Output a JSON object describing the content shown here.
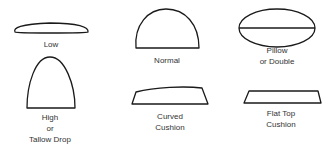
{
  "shapes": [
    {
      "id": "low",
      "lines": [
        "Low"
      ]
    },
    {
      "id": "normal",
      "lines": [
        "Normal"
      ]
    },
    {
      "id": "pillow",
      "lines": [
        "Pillow",
        "or Double"
      ]
    },
    {
      "id": "high",
      "lines": [
        "High",
        "or",
        "Tallow Drop"
      ]
    },
    {
      "id": "curved",
      "lines": [
        "Curved",
        "Cushion"
      ]
    },
    {
      "id": "flat",
      "lines": [
        "Flat Top",
        "Cushion"
      ]
    }
  ],
  "colors": {
    "stroke": "#1a1a1a",
    "text": "#333333"
  }
}
